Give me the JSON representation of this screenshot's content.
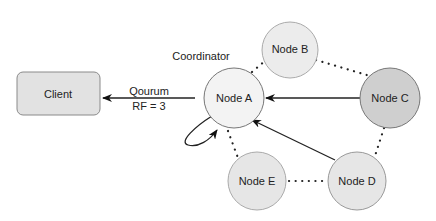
{
  "diagram": {
    "client": {
      "label": "Client"
    },
    "edge_label": {
      "line1": "Qourum",
      "line2": "RF = 3"
    },
    "coordinator_label": "Coordinator",
    "nodes": [
      {
        "id": "A",
        "label": "Node A",
        "fill": "#f2f2f2"
      },
      {
        "id": "B",
        "label": "Node B",
        "fill": "#ececec"
      },
      {
        "id": "C",
        "label": "Node C",
        "fill": "#cfcfcf"
      },
      {
        "id": "D",
        "label": "Node D",
        "fill": "#e6e6e6"
      },
      {
        "id": "E",
        "label": "Node E",
        "fill": "#e6e6e6"
      }
    ],
    "colors": {
      "stroke": "#555555",
      "client_fill": "#e2e2e2",
      "dotted": "#222222"
    }
  }
}
